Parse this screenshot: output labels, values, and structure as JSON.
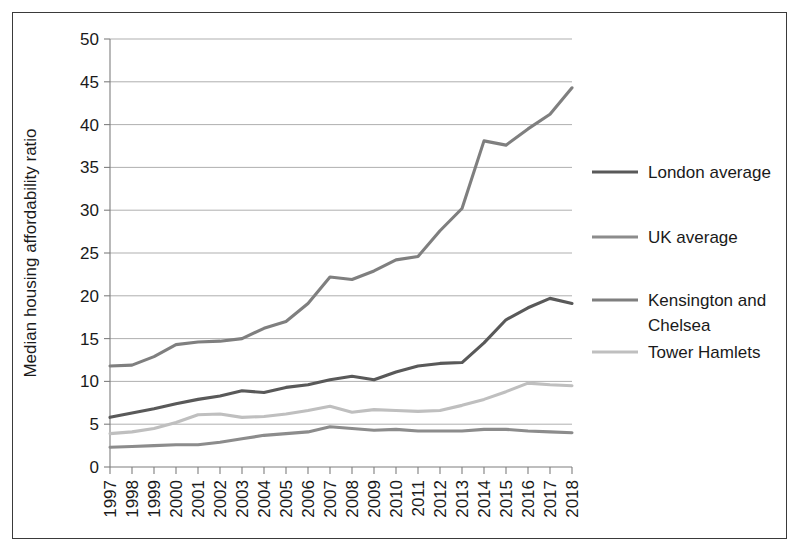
{
  "chart_data": {
    "type": "line",
    "title": "",
    "xlabel": "",
    "ylabel": "Median housing affordability ratio",
    "x": [
      "1997",
      "1998",
      "1999",
      "2000",
      "2001",
      "2002",
      "2003",
      "2004",
      "2005",
      "2006",
      "2007",
      "2008",
      "2009",
      "2010",
      "2011",
      "2012",
      "2013",
      "2014",
      "2015",
      "2016",
      "2017",
      "2018"
    ],
    "ylim": [
      0,
      50
    ],
    "ytick_step": 5,
    "yticks": [
      "0",
      "5",
      "10",
      "15",
      "20",
      "25",
      "30",
      "35",
      "40",
      "45",
      "50"
    ],
    "grid": true,
    "legend_position": "right",
    "series": [
      {
        "name": "London average",
        "color": "#595959",
        "values": [
          5.8,
          6.3,
          6.8,
          7.4,
          7.9,
          8.3,
          8.9,
          8.7,
          9.3,
          9.6,
          10.2,
          10.6,
          10.2,
          11.1,
          11.8,
          12.1,
          12.2,
          14.5,
          17.2,
          18.6,
          19.7,
          19.1
        ]
      },
      {
        "name": "UK average",
        "color": "#8c8c8c",
        "values": [
          2.3,
          2.4,
          2.5,
          2.6,
          2.6,
          2.9,
          3.3,
          3.7,
          3.9,
          4.1,
          4.7,
          4.5,
          4.3,
          4.4,
          4.2,
          4.2,
          4.2,
          4.4,
          4.4,
          4.2,
          4.1,
          4.0
        ]
      },
      {
        "name": "Kensington and Chelsea",
        "color": "#7f7f7f",
        "values": [
          11.8,
          11.9,
          12.9,
          14.3,
          14.6,
          14.7,
          15.0,
          16.2,
          17.0,
          19.1,
          22.2,
          21.9,
          22.9,
          24.2,
          24.6,
          27.6,
          30.2,
          38.1,
          37.6,
          39.5,
          41.2,
          44.3
        ]
      },
      {
        "name": "Tower Hamlets",
        "color": "#bfbfbf",
        "values": [
          3.9,
          4.1,
          4.5,
          5.2,
          6.1,
          6.2,
          5.8,
          5.9,
          6.2,
          6.6,
          7.1,
          6.4,
          6.7,
          6.6,
          6.5,
          6.6,
          7.2,
          7.9,
          8.8,
          9.8,
          9.6,
          9.5
        ]
      }
    ]
  },
  "legend": {
    "entries": [
      {
        "label": "London average"
      },
      {
        "label": "UK average"
      },
      {
        "label": "Kensington and",
        "label2": "Chelsea"
      },
      {
        "label": "Tower Hamlets"
      }
    ]
  }
}
